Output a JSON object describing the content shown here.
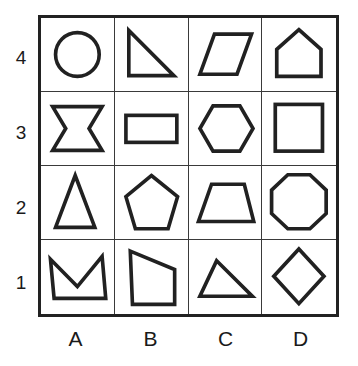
{
  "grid": {
    "columns": 4,
    "rows": 4,
    "column_labels": [
      "A",
      "B",
      "C",
      "D"
    ],
    "row_labels": [
      "4",
      "3",
      "2",
      "1"
    ],
    "line_color": "#212121",
    "background_color": "#ffffff"
  },
  "cells": [
    {
      "id": "A4",
      "column": "A",
      "row": "4",
      "shape_name": "circle",
      "svg_kind": "circle",
      "cx": 50,
      "cy": 50,
      "r": 30
    },
    {
      "id": "B4",
      "column": "B",
      "row": "4",
      "shape_name": "right-triangle",
      "svg_kind": "polygon",
      "points": "19,17 19,79 81,79"
    },
    {
      "id": "C4",
      "column": "C",
      "row": "4",
      "shape_name": "parallelogram",
      "svg_kind": "polygon",
      "points": "35,22 86,22 66,77 15,77"
    },
    {
      "id": "D4",
      "column": "D",
      "row": "4",
      "shape_name": "house-pentagon",
      "svg_kind": "polygon",
      "points": "50,16 80,43 80,80 20,80 20,43"
    },
    {
      "id": "A3",
      "column": "A",
      "row": "3",
      "shape_name": "concave-hexagon-banner",
      "svg_kind": "polygon",
      "points": "16,20 84,20 66,50 84,80 16,80 34,50"
    },
    {
      "id": "B3",
      "column": "B",
      "row": "3",
      "shape_name": "rectangle",
      "svg_kind": "rect",
      "x": 15,
      "y": 32,
      "width": 70,
      "height": 37
    },
    {
      "id": "C3",
      "column": "C",
      "row": "3",
      "shape_name": "hexagon",
      "svg_kind": "polygon",
      "points": "33,19 70,19 88,50 70,81 33,81 15,50"
    },
    {
      "id": "D3",
      "column": "D",
      "row": "3",
      "shape_name": "square",
      "svg_kind": "rect",
      "x": 18,
      "y": 17,
      "width": 64,
      "height": 64
    },
    {
      "id": "A2",
      "column": "A",
      "row": "2",
      "shape_name": "tall-triangle",
      "svg_kind": "polygon",
      "points": "47,13 74,84 20,84"
    },
    {
      "id": "B2",
      "column": "B",
      "row": "2",
      "shape_name": "pentagon",
      "svg_kind": "polygon",
      "points": "50,13 86,42 73,86 28,86 15,42"
    },
    {
      "id": "C2",
      "column": "C",
      "row": "2",
      "shape_name": "trapezoid",
      "svg_kind": "polygon",
      "points": "31,25 76,25 89,76 13,76"
    },
    {
      "id": "D2",
      "column": "D",
      "row": "2",
      "shape_name": "octagon",
      "svg_kind": "polygon",
      "points": "35,12 65,12 87,33 87,65 65,86 35,86 13,65 13,33"
    },
    {
      "id": "A1",
      "column": "A",
      "row": "1",
      "shape_name": "crown-concave-quadrilateral",
      "svg_kind": "polygon",
      "points": "13,26 50,63 84,22 89,79 18,79"
    },
    {
      "id": "B1",
      "column": "B",
      "row": "1",
      "shape_name": "irregular-quadrilateral",
      "svg_kind": "polygon",
      "points": "21,15 82,40 82,87 24,87"
    },
    {
      "id": "C1",
      "column": "C",
      "row": "1",
      "shape_name": "scalene-triangle",
      "svg_kind": "polygon",
      "points": "38,28 87,76 15,76"
    },
    {
      "id": "D1",
      "column": "D",
      "row": "1",
      "shape_name": "diamond",
      "svg_kind": "polygon",
      "points": "50,12 84,49 50,86 16,49"
    }
  ]
}
